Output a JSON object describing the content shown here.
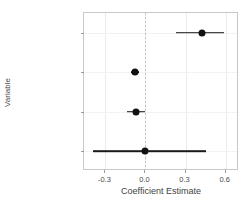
{
  "chart_data": {
    "type": "scatter",
    "subtype": "coefficient-forest-plot",
    "title": "",
    "xlabel": "Coefficient Estimate",
    "ylabel": "Variable",
    "xlim": [
      -0.46,
      0.7
    ],
    "xticks": [
      -0.3,
      0.0,
      0.3,
      0.6
    ],
    "xticklabels": [
      "-0.3",
      "0.0",
      "0.3",
      "0.6"
    ],
    "categories": [
      "Education",
      "Catholic",
      "Agriculture",
      "Infant Mortality"
    ],
    "grid": true,
    "legend": "none",
    "reference_line": {
      "value": 0.0,
      "style": "dashed",
      "color": "#c4c4c4"
    },
    "point_color": "#111111",
    "errorbar_color": "#1a1a1a",
    "panel_background": "#ffffff",
    "gridline_color": "#ebebeb",
    "points": [
      {
        "label": "Education",
        "estimate": 0.42,
        "low": 0.23,
        "high": 0.59
      },
      {
        "label": "Catholic",
        "estimate": -0.08,
        "low": -0.11,
        "high": -0.05
      },
      {
        "label": "Agriculture",
        "estimate": -0.07,
        "low": -0.14,
        "high": 0.0
      },
      {
        "label": "Infant Mortality",
        "estimate": 0.0,
        "low": -0.39,
        "high": 0.45
      }
    ]
  }
}
